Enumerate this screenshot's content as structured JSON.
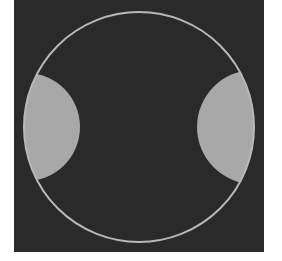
{
  "figure": {
    "colors": {
      "page_background": "#ffffff",
      "square_fill": "#2a2a2a",
      "circle_outline": "#b8b8b8",
      "lens_fill": "#a8a8a8"
    },
    "square": {
      "x": 14,
      "y": 0,
      "width": 250,
      "height": 252
    },
    "outer_circle": {
      "cx": 139,
      "cy": 127,
      "r": 115,
      "stroke_width": 2
    },
    "lenses": [
      {
        "name": "left-lens",
        "cut_circle": {
          "cx": 26,
          "cy": 127,
          "r": 54
        }
      },
      {
        "name": "right-lens",
        "cut_circle": {
          "cx": 254,
          "cy": 127,
          "r": 57
        }
      }
    ]
  }
}
